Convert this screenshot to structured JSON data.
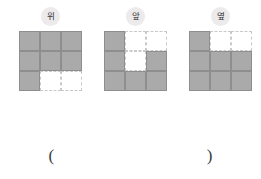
{
  "page": {
    "background_color": "#ffffff",
    "fill_color": "#aaaaaa",
    "fill_border_color": "#8e8e8e",
    "empty_border_color": "#c9c9c9",
    "label_badge_color": "#eceaea"
  },
  "figures": [
    {
      "label": "위",
      "label_meaning": "top-view",
      "grid_size": "3x3",
      "cells": [
        [
          "filled",
          "filled",
          "filled"
        ],
        [
          "filled",
          "filled",
          "filled"
        ],
        [
          "filled",
          "empty",
          "empty"
        ]
      ],
      "filled_count": 7
    },
    {
      "label": "앞",
      "label_meaning": "front-view",
      "grid_size": "3x3",
      "cells": [
        [
          "filled",
          "empty",
          "empty"
        ],
        [
          "filled",
          "empty",
          "filled"
        ],
        [
          "filled",
          "filled",
          "filled"
        ]
      ],
      "filled_count": 6
    },
    {
      "label": "옆",
      "label_meaning": "side-view",
      "grid_size": "3x3",
      "cells": [
        [
          "filled",
          "empty",
          "empty"
        ],
        [
          "filled",
          "filled",
          "filled"
        ],
        [
          "filled",
          "filled",
          "filled"
        ]
      ],
      "filled_count": 7
    }
  ],
  "answer": {
    "open_paren": "(",
    "close_paren": ")",
    "value": ""
  }
}
